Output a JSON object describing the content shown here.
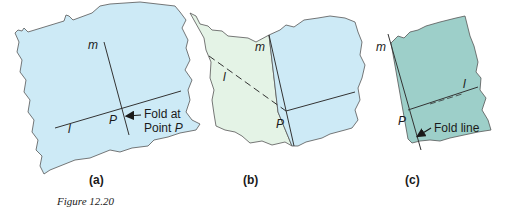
{
  "figure": {
    "caption": "Figure 12.20",
    "colors": {
      "paper_blue": "#cdeaf6",
      "paper_folded_green": "#e4f3e6",
      "paper_teal": "#9dcfc9",
      "outline": "#555555",
      "line": "#333333"
    },
    "panels": [
      {
        "id": "a",
        "label": "(a)",
        "line_labels": {
          "m": "m",
          "l": "l",
          "p": "P"
        },
        "annotation": {
          "line1": "Fold at",
          "line2_prefix": "Point ",
          "line2_var": "P"
        }
      },
      {
        "id": "b",
        "label": "(b)",
        "line_labels": {
          "m": "m",
          "l": "l",
          "p": "P"
        }
      },
      {
        "id": "c",
        "label": "(c)",
        "line_labels": {
          "m": "m",
          "l": "l",
          "p": "P"
        },
        "annotation": {
          "text": "Fold line"
        }
      }
    ]
  }
}
